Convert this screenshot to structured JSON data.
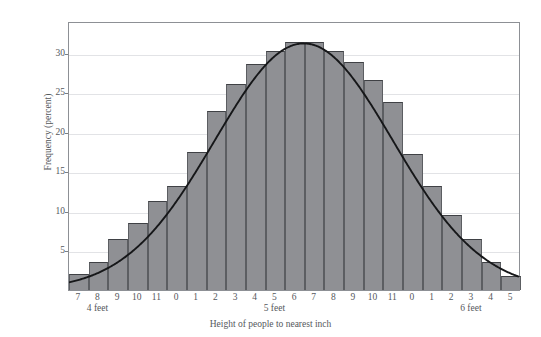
{
  "chart_data": {
    "type": "bar",
    "title": "",
    "xlabel": "Height of people to nearest inch",
    "ylabel": "Frequency (percent)",
    "ylim": [
      0,
      34
    ],
    "yticks": [
      5,
      10,
      15,
      20,
      25,
      30
    ],
    "grid": true,
    "legend": null,
    "categories": [
      "7",
      "8",
      "9",
      "10",
      "11",
      "0",
      "1",
      "2",
      "3",
      "4",
      "5",
      "6",
      "7",
      "8",
      "9",
      "10",
      "11",
      "0",
      "1",
      "2",
      "3",
      "4",
      "5"
    ],
    "group_labels": [
      {
        "label": "4 feet",
        "at_category_index": 1
      },
      {
        "label": "5 feet",
        "at_category_index": 10
      },
      {
        "label": "6 feet",
        "at_category_index": 20
      }
    ],
    "values": [
      2.0,
      3.6,
      6.5,
      8.5,
      11.3,
      13.2,
      17.5,
      22.6,
      26.0,
      28.6,
      30.2,
      31.4,
      31.4,
      30.2,
      28.8,
      26.6,
      23.8,
      17.2,
      13.2,
      9.5,
      6.5,
      3.6,
      1.8
    ],
    "overlay_curve": {
      "name": "normal curve",
      "mean_category_index": 11.5,
      "peak_value": 31.4,
      "sd_in_categories": 4.55
    }
  },
  "axes": {
    "y_tick_labels": [
      "30",
      "25",
      "20",
      "15",
      "10",
      "5"
    ],
    "y_tick_values": [
      30,
      25,
      20,
      15,
      10,
      5
    ],
    "x_tick_labels": [
      "7",
      "8",
      "9",
      "10",
      "11",
      "0",
      "1",
      "2",
      "3",
      "4",
      "5",
      "6",
      "7",
      "8",
      "9",
      "10",
      "11",
      "0",
      "1",
      "2",
      "3",
      "4",
      "5"
    ],
    "x_group_labels": [
      "4 feet",
      "5 feet",
      "6 feet"
    ],
    "x_axis_title": "Height of people to nearest inch",
    "y_axis_title": "Frequency (percent)"
  },
  "colors": {
    "bar_fill": "#8f9094",
    "bar_edge": "#5c5e62",
    "curve": "#161719",
    "gridline": "#e2e3e6",
    "frame": "#8d9095",
    "text": "#55585c",
    "background": "#ffffff"
  }
}
